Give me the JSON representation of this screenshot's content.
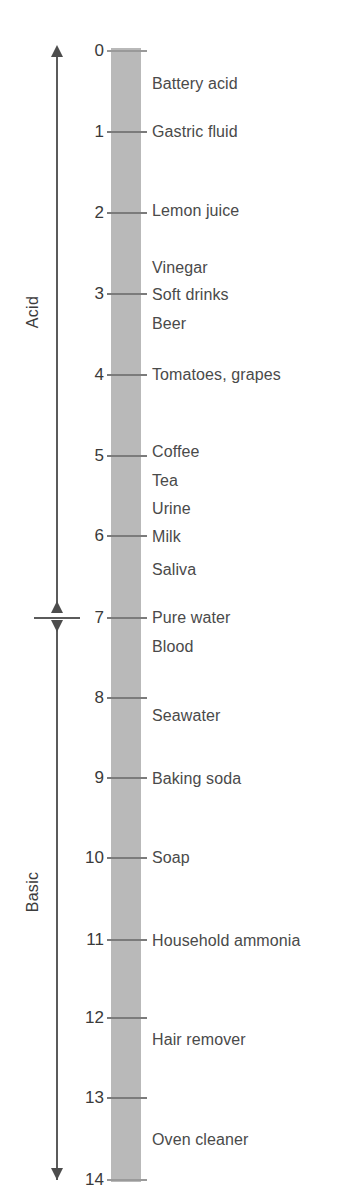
{
  "figure": {
    "bar_color": "#b9b9b9",
    "axis_color": "#5b5b5b",
    "text_color": "#4a4a4a"
  },
  "regions": [
    {
      "name": "acid",
      "label": "Acid"
    },
    {
      "name": "basic",
      "label": "Basic"
    }
  ],
  "chart_data": {
    "type": "table",
    "ylabel": "pH",
    "ylim": [
      0,
      14
    ],
    "axis_direction": "increasing downward",
    "regions": [
      "Acid",
      "Basic"
    ],
    "neutral_point": 7,
    "tick_labels": [
      "0",
      "1",
      "2",
      "3",
      "4",
      "5",
      "6",
      "7",
      "8",
      "9",
      "10",
      "11",
      "12",
      "13",
      "14"
    ],
    "ticks": [
      0,
      1,
      2,
      3,
      4,
      5,
      6,
      7,
      8,
      9,
      10,
      11,
      12,
      13,
      14
    ],
    "categories": [
      "Battery acid",
      "Gastric fluid",
      "Lemon juice",
      "Vinegar",
      "Soft drinks",
      "Beer",
      "Tomatoes, grapes",
      "Coffee",
      "Tea",
      "Urine",
      "Milk",
      "Saliva",
      "Pure water",
      "Blood",
      "Seawater",
      "Baking soda",
      "Soap",
      "Household ammonia",
      "Hair remover",
      "Oven cleaner"
    ],
    "values": [
      0.4,
      1.0,
      2.0,
      2.8,
      3.0,
      3.3,
      4.0,
      5.0,
      5.3,
      5.7,
      6.0,
      6.4,
      7.0,
      7.3,
      8.2,
      9.0,
      10.0,
      11.0,
      12.2,
      13.5
    ]
  },
  "ticks": [
    {
      "value": "0",
      "y": 51
    },
    {
      "value": "1",
      "y": 132
    },
    {
      "value": "2",
      "y": 213
    },
    {
      "value": "3",
      "y": 294
    },
    {
      "value": "4",
      "y": 375
    },
    {
      "value": "5",
      "y": 456
    },
    {
      "value": "6",
      "y": 536
    },
    {
      "value": "7",
      "y": 618
    },
    {
      "value": "8",
      "y": 698
    },
    {
      "value": "9",
      "y": 778
    },
    {
      "value": "10",
      "y": 858
    },
    {
      "value": "11",
      "y": 940
    },
    {
      "value": "12",
      "y": 1018
    },
    {
      "value": "13",
      "y": 1098
    },
    {
      "value": "14",
      "y": 1180
    }
  ],
  "substances": [
    {
      "name": "Battery acid",
      "y": 84
    },
    {
      "name": "Gastric fluid",
      "y": 132
    },
    {
      "name": "Lemon juice",
      "y": 211
    },
    {
      "name": "Vinegar",
      "y": 268
    },
    {
      "name": "Soft drinks",
      "y": 295
    },
    {
      "name": "Beer",
      "y": 324
    },
    {
      "name": "Tomatoes, grapes",
      "y": 375
    },
    {
      "name": "Coffee",
      "y": 452
    },
    {
      "name": "Tea",
      "y": 481
    },
    {
      "name": "Urine",
      "y": 509
    },
    {
      "name": "Milk",
      "y": 537
    },
    {
      "name": "Saliva",
      "y": 570
    },
    {
      "name": "Pure water",
      "y": 618
    },
    {
      "name": "Blood",
      "y": 647
    },
    {
      "name": "Seawater",
      "y": 716
    },
    {
      "name": "Baking soda",
      "y": 779
    },
    {
      "name": "Soap",
      "y": 858
    },
    {
      "name": "Household ammonia",
      "y": 941
    },
    {
      "name": "Hair remover",
      "y": 1040
    },
    {
      "name": "Oven cleaner",
      "y": 1140
    }
  ]
}
